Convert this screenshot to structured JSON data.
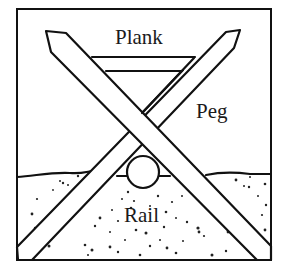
{
  "diagram": {
    "labels": {
      "plank": "Plank",
      "peg": "Peg",
      "rail": "Rail"
    },
    "colors": {
      "line": "#111111",
      "background": "#ffffff",
      "ground_dots": "#222222"
    }
  }
}
